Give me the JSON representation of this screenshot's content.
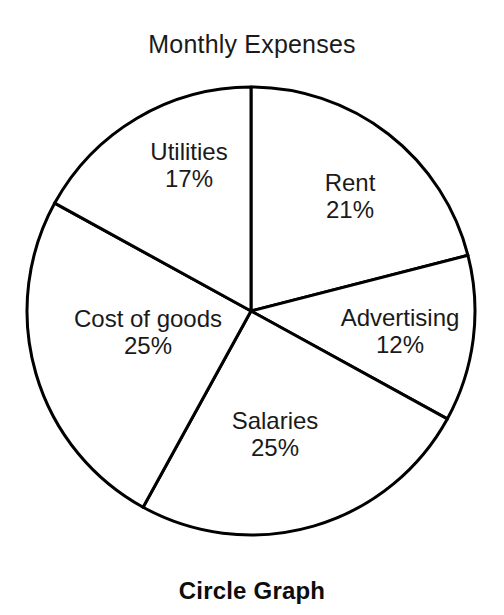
{
  "chart_data": {
    "type": "pie",
    "title": "Monthly Expenses",
    "caption": "Circle Graph",
    "categories": [
      "Rent",
      "Advertising",
      "Salaries",
      "Cost of goods",
      "Utilities"
    ],
    "values": [
      21,
      12,
      25,
      25,
      17
    ],
    "value_suffix": "%",
    "total": 100,
    "start_angle_deg": 0,
    "direction": "clockwise",
    "legend": "none",
    "grid": false,
    "slice_fill": "#ffffff",
    "slice_stroke": "#000000",
    "slices": [
      {
        "label": "Rent",
        "value": 21,
        "display_value": "21%"
      },
      {
        "label": "Advertising",
        "value": 12,
        "display_value": "12%"
      },
      {
        "label": "Salaries",
        "value": 25,
        "display_value": "25%"
      },
      {
        "label": "Cost of goods",
        "value": 25,
        "display_value": "25%"
      },
      {
        "label": "Utilities",
        "value": 17,
        "display_value": "17%"
      }
    ]
  },
  "figure": {
    "title": "Monthly Expenses",
    "caption": "Circle Graph"
  }
}
